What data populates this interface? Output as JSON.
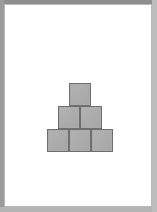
{
  "image": {
    "width": 157,
    "height": 212,
    "background_color": "#ffffff",
    "frame_color": "#a8a8a8",
    "page_border_color": "#b9b9b9"
  },
  "figure": {
    "name": "block-pyramid",
    "block_count": 6,
    "row_counts": [
      3,
      2,
      1
    ],
    "block_size_px": 22,
    "fill_color": "#ababab",
    "stroke_color": "#6f6f6f",
    "caption": "",
    "blocks": [
      {
        "id": "bottom-left",
        "row": 0,
        "col": 0,
        "x": 42,
        "y": 124,
        "w": 22,
        "h": 23
      },
      {
        "id": "bottom-center",
        "row": 0,
        "col": 1,
        "x": 64,
        "y": 124,
        "w": 22,
        "h": 23
      },
      {
        "id": "bottom-right",
        "row": 0,
        "col": 2,
        "x": 86,
        "y": 124,
        "w": 22,
        "h": 23
      },
      {
        "id": "middle-left",
        "row": 1,
        "col": 0,
        "x": 53,
        "y": 101,
        "w": 22,
        "h": 23
      },
      {
        "id": "middle-right",
        "row": 1,
        "col": 1,
        "x": 75,
        "y": 101,
        "w": 22,
        "h": 23
      },
      {
        "id": "top-center",
        "row": 2,
        "col": 0,
        "x": 64,
        "y": 78,
        "w": 22,
        "h": 23
      }
    ]
  }
}
